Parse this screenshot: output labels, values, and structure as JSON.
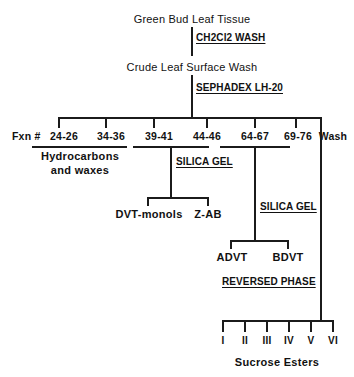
{
  "diagram": {
    "type": "flowchart",
    "width": 354,
    "height": 377,
    "line_color": "#1b1b1b",
    "text_color": "#111111",
    "background": "#ffffff"
  },
  "nodes": {
    "source": "Green Bud Leaf Tissue",
    "crude": "Crude Leaf Surface Wash",
    "hydrocarbons_line1": "Hydrocarbons",
    "hydrocarbons_line2": "and  waxes",
    "dvt_monols": "DVT-monols",
    "z_ab": "Z-AB",
    "advt": "ADVT",
    "bdvt": "BDVT",
    "sucrose_esters": "Sucrose  Esters"
  },
  "reagents": {
    "wash_ch2cl2": "CH2Cl2 WASH",
    "sephadex": "SEPHADEX LH-20",
    "silica_gel_1": "SILICA GEL",
    "silica_gel_2": "SILICA GEL",
    "reversed_phase": "REVERSED PHASE"
  },
  "fractions": {
    "prefix": "Fxn #",
    "items": [
      {
        "label": "24-26",
        "x": 78
      },
      {
        "label": "34-36",
        "x": 126
      },
      {
        "label": "39-41",
        "x": 174
      },
      {
        "label": "44-46",
        "x": 222
      },
      {
        "label": "64-67",
        "x": 270
      },
      {
        "label": "69-76",
        "x": 316
      },
      {
        "label": "Wash",
        "x": 358
      }
    ]
  },
  "sucrose_fractions": [
    {
      "label": "I",
      "x": 222
    },
    {
      "label": "II",
      "x": 244
    },
    {
      "label": "III",
      "x": 266
    },
    {
      "label": "IV",
      "x": 288
    },
    {
      "label": "V",
      "x": 310
    },
    {
      "label": "VI",
      "x": 332
    }
  ]
}
